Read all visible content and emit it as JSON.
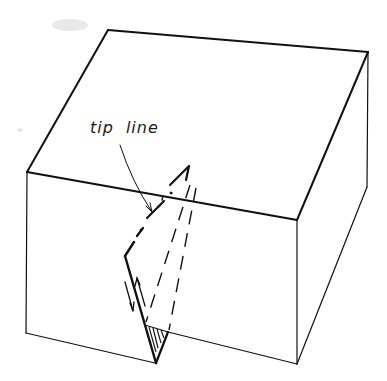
{
  "figure": {
    "type": "block-diagram",
    "annotation": {
      "word1": "tip",
      "word2": "line"
    },
    "colors": {
      "ink": "#111111",
      "background": "#ffffff"
    }
  }
}
